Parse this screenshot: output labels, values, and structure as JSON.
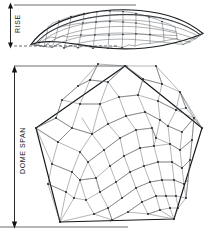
{
  "diagram": {
    "background_color": "#ffffff",
    "line_color": "#555a5e",
    "outline_color": "#14181b",
    "width": 210,
    "height": 235,
    "views": [
      {
        "id": "elevation",
        "name": "dome-elevation-view",
        "description": "Shallow arched dome shown in side elevation with rhombic facet mesh",
        "dimension_label": "RISE"
      },
      {
        "id": "plan",
        "name": "dome-plan-view",
        "description": "Pentagonal dome footprint in plan with rhombic (Penrose) tiling",
        "dimension_label": "DOME SPAN"
      }
    ],
    "labels": {
      "rise": "RISE",
      "dome_span": "DOME SPAN"
    },
    "annotations": {
      "rise_arrow": "double-headed vertical dimension arrow",
      "span_arrow": "double-headed vertical dimension arrow"
    }
  }
}
